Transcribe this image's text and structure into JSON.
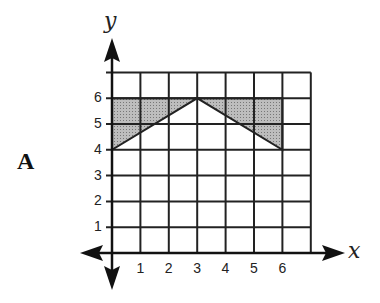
{
  "problem_label": "A",
  "axes": {
    "x_label": "x",
    "y_label": "y"
  },
  "x_ticks": [
    "1",
    "2",
    "3",
    "4",
    "5",
    "6"
  ],
  "y_ticks": [
    "1",
    "2",
    "3",
    "4",
    "5",
    "6"
  ],
  "shaded_regions": [
    {
      "name": "left-triangle",
      "points": [
        [
          0,
          4
        ],
        [
          0,
          6
        ],
        [
          3,
          6
        ]
      ]
    },
    {
      "name": "right-triangle",
      "points": [
        [
          3,
          6
        ],
        [
          6,
          6
        ],
        [
          6,
          4
        ]
      ]
    }
  ],
  "colors": {
    "grid": "#222222",
    "shade": "#a9a9a9"
  }
}
